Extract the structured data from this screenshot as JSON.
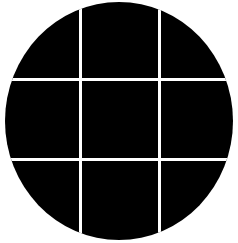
{
  "figure": {
    "rows": 3,
    "columns": 3,
    "colors": {
      "background": "#ffffff",
      "circle": "#000000",
      "grid_lines": "#ffffff"
    }
  }
}
